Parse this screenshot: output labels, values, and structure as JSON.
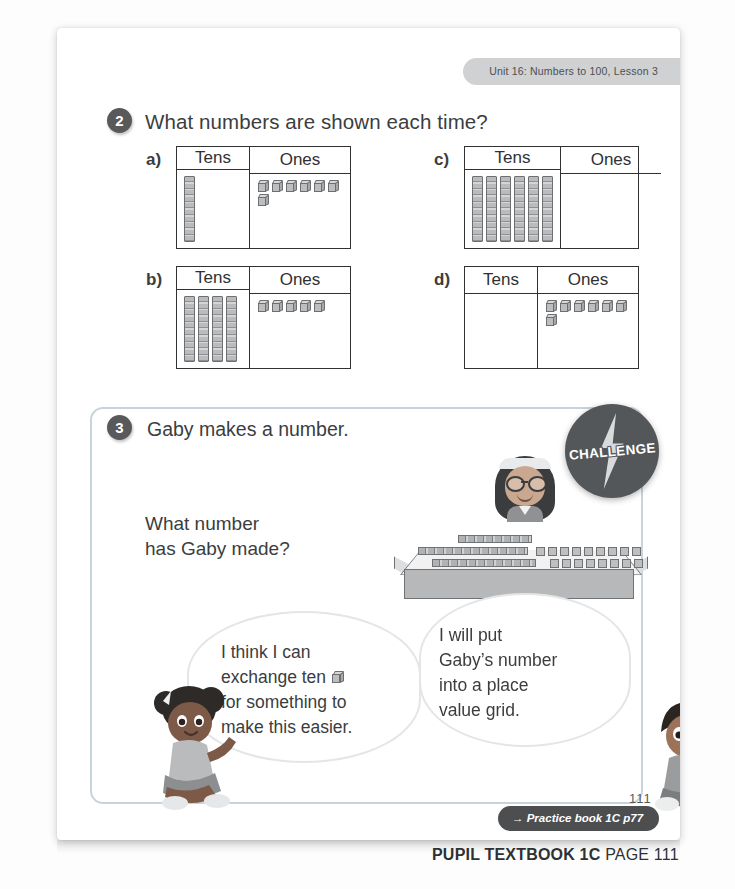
{
  "header": {
    "unit_tab": "Unit 16: Numbers to 100, Lesson 3"
  },
  "question2": {
    "number": "2",
    "prompt": "What numbers are shown each time?",
    "grids": [
      {
        "label": "a)",
        "tens_header": "Tens",
        "ones_header": "Ones",
        "tens": 1,
        "ones": 7
      },
      {
        "label": "c)",
        "tens_header": "Tens",
        "ones_header": "Ones",
        "tens": 6,
        "ones": 0
      },
      {
        "label": "b)",
        "tens_header": "Tens",
        "ones_header": "Ones",
        "tens": 4,
        "ones": 5
      },
      {
        "label": "d)",
        "tens_header": "Tens",
        "ones_header": "Ones",
        "tens": 0,
        "ones": 7
      }
    ]
  },
  "question3": {
    "number": "3",
    "prompt": "Gaby makes a number.",
    "sub_prompt_line1": "What number",
    "sub_prompt_line2": "has Gaby made?",
    "challenge_badge": "CHALLENGE",
    "table_tens": 3,
    "table_ones": 17,
    "bubble_left": {
      "line1": "I think I can",
      "line2_before": "exchange ten",
      "line2_after": "",
      "line3": "for something to",
      "line4": "make this easier."
    },
    "bubble_right": {
      "line1": "I will put",
      "line2": "Gaby’s number",
      "line3": "into a place",
      "line4": "value grid."
    }
  },
  "footer": {
    "practice_arrow": "→",
    "practice_label": "Practice book 1C p77",
    "folio": "111",
    "caption_bold": "PUPIL TEXTBOOK 1C",
    "caption_light": "PAGE 111"
  }
}
